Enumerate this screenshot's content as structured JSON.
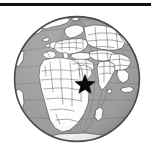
{
  "figure": {
    "type": "globe-locator-map",
    "width": 153,
    "height": 153,
    "background_color": "#ffffff"
  },
  "top_rule": {
    "name": "horizontal-rule",
    "color": "#111111",
    "x": 0,
    "y": 3,
    "width": 151,
    "thickness": 3
  },
  "globe": {
    "projection": "orthographic",
    "center_lon": 30,
    "center_lat": 18,
    "center_x": 77,
    "center_y": 79,
    "radius": 63,
    "ocean_color": "#9b9b9b",
    "land_color": "#fdfdfd",
    "border_color": "#3a3a3a",
    "rim_color": "#4a4a4a",
    "graticule_color": "#6e6e6e",
    "graticule_spacing_degrees": 20,
    "visible_regions": [
      "Europe",
      "Africa",
      "Asia",
      "Middle East",
      "Indian Ocean",
      "Atlantic Ocean",
      "Greenland",
      "Arctic",
      "South Asia",
      "Southeast Asia"
    ]
  },
  "marker": {
    "name": "location-star",
    "shape": "five-pointed-star",
    "color": "#0a0a0a",
    "x": 85,
    "y": 85,
    "size": 19,
    "region_label": "Arabian Peninsula / Persian Gulf"
  },
  "chart_data": {
    "type": "map",
    "title": "",
    "legend": [],
    "annotations": [
      {
        "label": "location marker",
        "symbol": "star",
        "x": 85,
        "y": 85
      }
    ]
  }
}
